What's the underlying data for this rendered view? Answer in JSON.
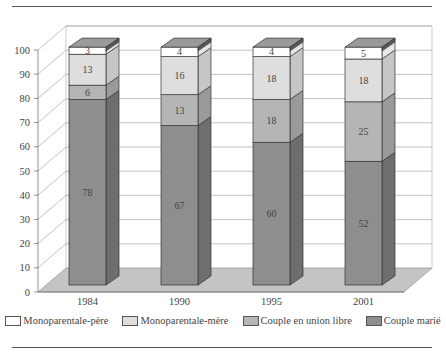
{
  "chart_data": {
    "type": "bar",
    "stacked": true,
    "three_d": true,
    "title": "",
    "xlabel": "",
    "ylabel": "",
    "categories": [
      "1984",
      "1990",
      "1995",
      "2001"
    ],
    "series": [
      {
        "name": "Couple marié",
        "values": [
          78,
          67,
          60,
          52
        ],
        "color": "#8e8e8e",
        "side": "#6e6e6e"
      },
      {
        "name": "Couple en union libre",
        "values": [
          6,
          13,
          18,
          25
        ],
        "color": "#b5b5b5",
        "side": "#9a9a9a"
      },
      {
        "name": "Monoparentale-mère",
        "values": [
          13,
          16,
          18,
          18
        ],
        "color": "#dedede",
        "side": "#c6c6c6"
      },
      {
        "name": "Monoparentale-père",
        "values": [
          3,
          4,
          4,
          5
        ],
        "color": "#ffffff",
        "side": "#e6e6e6"
      }
    ],
    "ylim": [
      0,
      100
    ],
    "yticks": [
      0,
      10,
      20,
      30,
      40,
      50,
      60,
      70,
      80,
      90,
      100
    ],
    "grid": true,
    "legend_position": "bottom",
    "legend_order": [
      "Monoparentale-père",
      "Monoparentale-mère",
      "Couple en union libre",
      "Couple marié"
    ]
  },
  "legend": [
    {
      "label": "Monoparentale-père",
      "color": "#ffffff"
    },
    {
      "label": "Monoparentale-mère",
      "color": "#dedede"
    },
    {
      "label": "Couple en union libre",
      "color": "#b5b5b5"
    },
    {
      "label": "Couple marié",
      "color": "#8e8e8e"
    }
  ]
}
